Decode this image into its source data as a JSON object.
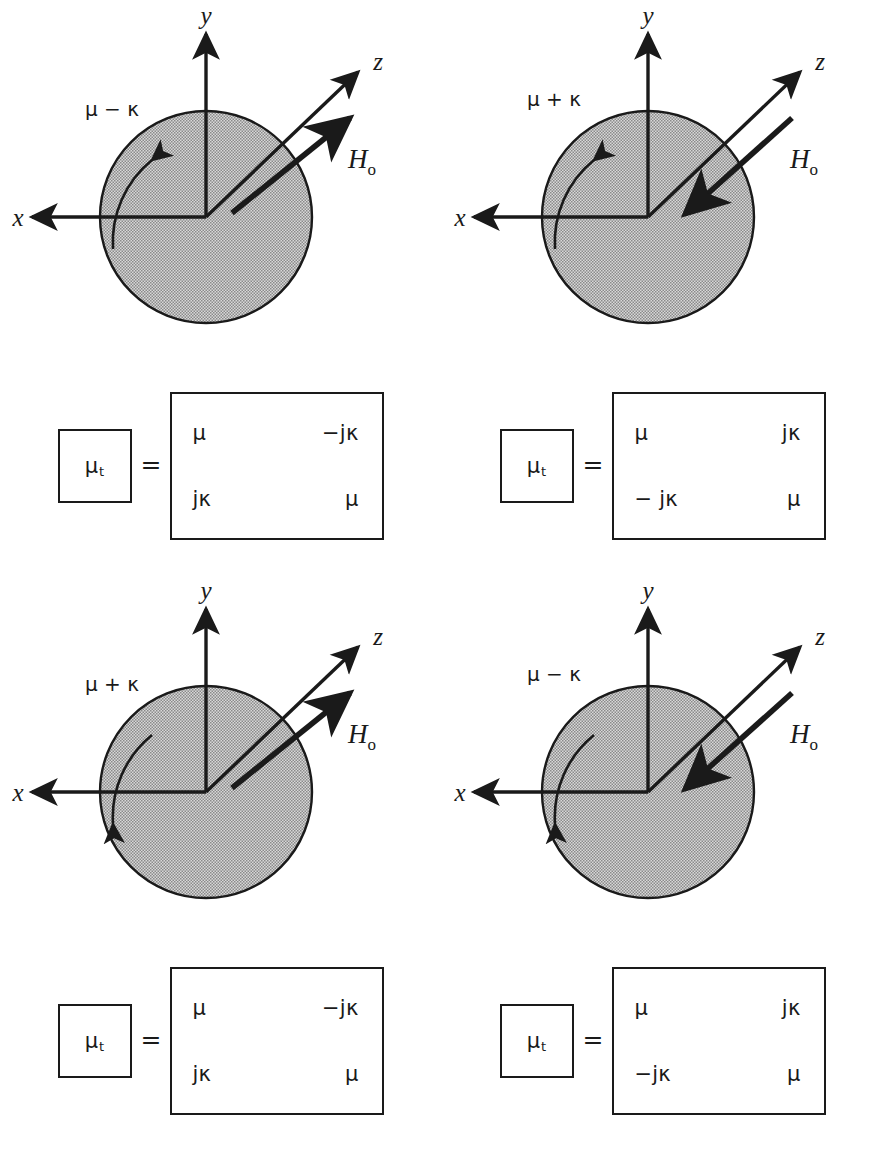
{
  "figure": {
    "colors": {
      "ink": "#1a1a1a",
      "stipple_fill": "#bdbdbd",
      "background": "#ffffff"
    }
  },
  "axis_labels": {
    "x": "x",
    "y": "y",
    "z": "z"
  },
  "field_label": {
    "symbol": "H",
    "subscript": "o"
  },
  "matrix_lhs": {
    "symbol": "μ",
    "subscript": "t"
  },
  "equals": "=",
  "panels": [
    {
      "id": "top-left",
      "permeability_label": "μ − κ",
      "h0_direction": "outward",
      "precession": "clockwise",
      "matrix": [
        [
          "μ",
          "−jκ"
        ],
        [
          "jκ",
          "μ"
        ]
      ]
    },
    {
      "id": "top-right",
      "permeability_label": "μ + κ",
      "h0_direction": "inward",
      "precession": "clockwise",
      "matrix": [
        [
          "μ",
          "jκ"
        ],
        [
          "− jκ",
          "μ"
        ]
      ]
    },
    {
      "id": "bottom-left",
      "permeability_label": "μ + κ",
      "h0_direction": "outward",
      "precession": "counterclockwise",
      "matrix": [
        [
          "μ",
          "−jκ"
        ],
        [
          "jκ",
          "μ"
        ]
      ]
    },
    {
      "id": "bottom-right",
      "permeability_label": "μ − κ",
      "h0_direction": "inward",
      "precession": "counterclockwise",
      "matrix": [
        [
          "μ",
          "jκ"
        ],
        [
          "−jκ",
          "μ"
        ]
      ]
    }
  ]
}
